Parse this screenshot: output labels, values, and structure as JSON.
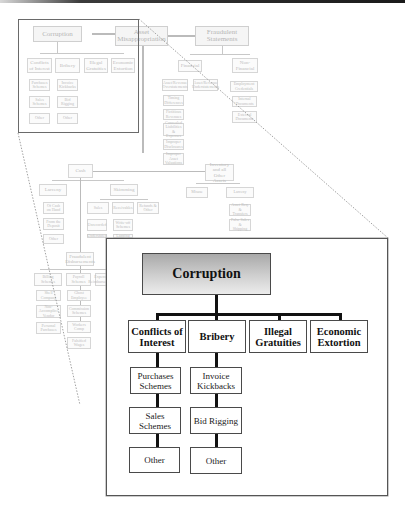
{
  "background_tree": {
    "top_row": [
      {
        "label": "Corruption"
      },
      {
        "label": "Asset Misappropriation"
      },
      {
        "label": "Fraudulent Statements"
      }
    ],
    "corruption_children": [
      "Conflicts of Interest",
      "Bribery",
      "Illegal Gratuities",
      "Economic Extortion"
    ],
    "conflicts_children": [
      "Purchases Schemes",
      "Sales Schemes",
      "Other"
    ],
    "bribery_children": [
      "Invoice Kickbacks",
      "Bid Rigging",
      "Other"
    ],
    "statements_children": [
      "Financial",
      "Non-Financial"
    ],
    "financial_children": [
      "Asset/Revenue Overstatements",
      "Asset/Revenue Understatements"
    ],
    "financial_sub": [
      "Timing Differences",
      "Fictitious Revenues",
      "Concealed Liabilities & Expenses",
      "Improper Disclosures",
      "Improper Asset Valuations"
    ],
    "nonfinancial_sub": [
      "Employment Credentials",
      "Internal Documents",
      "External Documents"
    ],
    "cash": {
      "label": "Cash",
      "children": [
        "Larceny",
        "Skimming"
      ]
    },
    "larceny_children": [
      "Of Cash on Hand",
      "From the Deposit",
      "Other"
    ],
    "skimming_children": [
      "Sales",
      "Receivables",
      "Refunds & Other"
    ],
    "sales_children": [
      "Unrecorded",
      "Understated"
    ],
    "receivables_children": [
      "Write-off Schemes",
      "Lapping"
    ],
    "disbursements": {
      "label": "Fraudulent Disbursements",
      "children": [
        "Billing Schemes",
        "Payroll Schemes",
        "Expense Reimbursement"
      ]
    },
    "billing_children": [
      "Shell Company",
      "Non-Accomplice Vendor",
      "Personal Purchases"
    ],
    "payroll_children": [
      "Ghost Employee",
      "Commission Schemes",
      "Workers Comp",
      "Falsified Wages"
    ],
    "inventory": {
      "label": "Inventory and all Other Assets",
      "children": [
        "Misuse",
        "Larceny"
      ]
    },
    "inv_larceny_children": [
      "Asset Req. & Transfers",
      "False Sales & Shipping"
    ]
  },
  "inset": {
    "root": "Corruption",
    "categories": [
      {
        "label": "Conflicts of Interest",
        "children": [
          "Purchases Schemes",
          "Sales Schemes",
          "Other"
        ]
      },
      {
        "label": "Bribery",
        "children": [
          "Invoice Kickbacks",
          "Bid Rigging",
          "Other"
        ]
      },
      {
        "label": "Illegal Gratuities",
        "children": []
      },
      {
        "label": "Economic Extortion",
        "children": []
      }
    ]
  },
  "colors": {
    "inset_border": "#555555",
    "connector": "#111111",
    "faded_box_border": "#d6d6d6",
    "zoom_line": "#8a8a8a"
  }
}
